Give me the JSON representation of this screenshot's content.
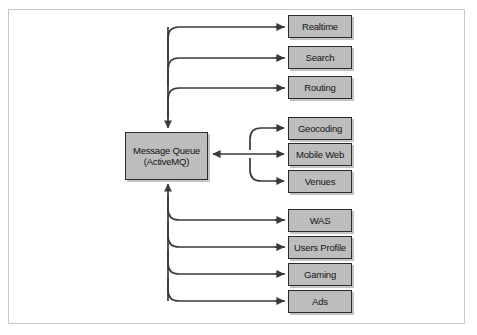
{
  "figure": {
    "type": "architecture-flow-diagram",
    "colors": {
      "node_fill": "#bdbdbd",
      "node_border": "#2b2b2b",
      "arrow": "#3a3a3a",
      "frame_border": "#c9c9c9",
      "background": "#ffffff"
    }
  },
  "hub": {
    "name": "message-queue",
    "line1": "Message Queue",
    "line2": "(ActiveMQ)"
  },
  "groups": [
    {
      "id": "producers-top",
      "direction": "into-queue",
      "nodes": [
        {
          "id": "realtime",
          "label": "Realtime"
        },
        {
          "id": "search",
          "label": "Search"
        },
        {
          "id": "routing",
          "label": "Routing"
        }
      ]
    },
    {
      "id": "bidirectional-middle",
      "direction": "bidirectional",
      "nodes": [
        {
          "id": "geocoding",
          "label": "Geocoding"
        },
        {
          "id": "mobile-web",
          "label": "Mobile Web"
        },
        {
          "id": "venues",
          "label": "Venues"
        }
      ]
    },
    {
      "id": "consumers-bottom",
      "direction": "from-queue",
      "nodes": [
        {
          "id": "was",
          "label": "WAS"
        },
        {
          "id": "users-profile",
          "label": "Users Profile"
        },
        {
          "id": "gaming",
          "label": "Gaming"
        },
        {
          "id": "ads",
          "label": "Ads"
        }
      ]
    }
  ]
}
